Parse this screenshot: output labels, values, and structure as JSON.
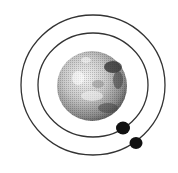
{
  "diagram": {
    "description": "Planet with two moons on concentric orbits",
    "planet": {
      "cx": 92,
      "cy": 86,
      "r": 35,
      "fill_light": "#d9d9d9",
      "fill_dark": "#3a3a3a"
    },
    "orbits": [
      {
        "name": "inner-orbit",
        "cx": 93,
        "cy": 85,
        "rx": 55,
        "ry": 52,
        "stroke": "#333333"
      },
      {
        "name": "outer-orbit",
        "cx": 93,
        "cy": 85,
        "rx": 72,
        "ry": 70,
        "stroke": "#333333"
      }
    ],
    "moons": [
      {
        "name": "inner-moon",
        "cx": 123,
        "cy": 128,
        "r": 7,
        "fill": "#111111"
      },
      {
        "name": "outer-moon",
        "cx": 136,
        "cy": 143,
        "r": 6.5,
        "fill": "#111111"
      }
    ]
  }
}
